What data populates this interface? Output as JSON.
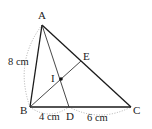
{
  "diagram": {
    "type": "geometry-triangle",
    "points": {
      "A": {
        "label": "A",
        "x": 42,
        "y": 25
      },
      "B": {
        "label": "B",
        "x": 30,
        "y": 107
      },
      "C": {
        "label": "C",
        "x": 131,
        "y": 107
      },
      "D": {
        "label": "D",
        "x": 69,
        "y": 107
      },
      "E": {
        "label": "E",
        "x": 81,
        "y": 61
      },
      "I": {
        "label": "I",
        "x": 61,
        "y": 79
      }
    },
    "segments": [
      {
        "from": "A",
        "to": "B",
        "style": "solid"
      },
      {
        "from": "A",
        "to": "C",
        "style": "solid"
      },
      {
        "from": "B",
        "to": "C",
        "style": "solid"
      },
      {
        "from": "A",
        "to": "D",
        "style": "solid-thin"
      },
      {
        "from": "B",
        "to": "E",
        "style": "solid-thin"
      }
    ],
    "measurements": {
      "AB": "8 cm",
      "BD": "4 cm",
      "DC": "6 cm"
    },
    "colors": {
      "line": "#1a1a1a",
      "dotted_arc": "#999999",
      "text": "#222222",
      "background": "#ffffff"
    }
  }
}
